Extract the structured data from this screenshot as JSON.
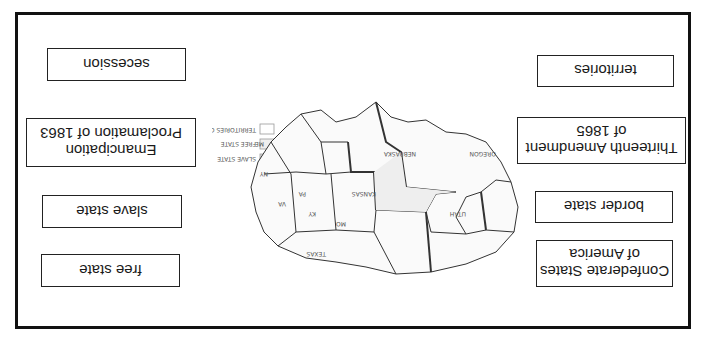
{
  "worksheet": {
    "orientation": "rotated-180",
    "terms": [
      {
        "id": "secession",
        "label": "secession"
      },
      {
        "id": "emancipation",
        "label": "Emancipation\nProclamation of 1863"
      },
      {
        "id": "slave-state",
        "label": "slave state"
      },
      {
        "id": "free-state",
        "label": "free state"
      },
      {
        "id": "territories",
        "label": "territories"
      },
      {
        "id": "thirteenth",
        "label": "Thirteenth Amendment\nof 1865"
      },
      {
        "id": "border-state",
        "label": "border state"
      },
      {
        "id": "confederate",
        "label": "Confederate States\nof America"
      }
    ],
    "map": {
      "description": "Hand-drawn map of the United States c. 1860s",
      "labels": [
        "ME",
        "NY",
        "PA",
        "VA",
        "NC",
        "SC",
        "GA",
        "FLA",
        "ALA",
        "MISS",
        "LA",
        "TEXAS",
        "ARK",
        "TENN",
        "KY",
        "MO",
        "ILL",
        "IND",
        "OHIO",
        "MICH",
        "WIS",
        "IOWA",
        "MINN",
        "KANSAS TERR",
        "INDIAN TERR",
        "NEBRASKA TERR",
        "NEW MEXICO TERR",
        "UTAH TERR",
        "OREGON TERR",
        "WASHINGTON TERR",
        "CALIF",
        "MINNESOTA TERR"
      ]
    },
    "legend": {
      "items": [
        {
          "label": "SLAVE STATE"
        },
        {
          "label": "FREE STATE"
        },
        {
          "label": "TERRITORIES OPEN TO SLAVERY"
        }
      ]
    }
  }
}
